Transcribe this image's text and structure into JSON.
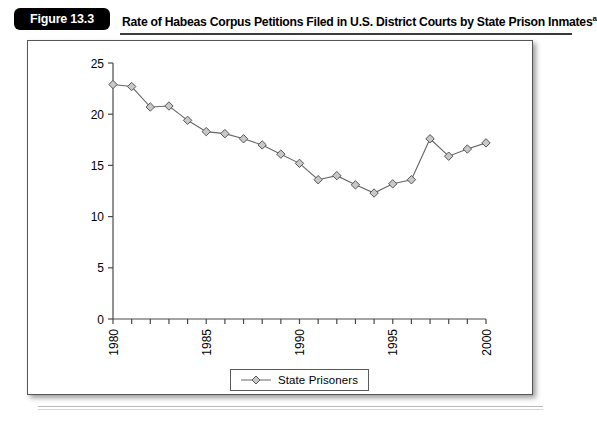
{
  "figure": {
    "badge_label": "Figure 13.3",
    "title": "Rate of Habeas Corpus Petitions Filed in U.S. District Courts by State Prison Inmates",
    "title_superscript": "a"
  },
  "legend": {
    "position": "bottom-center",
    "entries": [
      {
        "label": "State Prisoners",
        "marker": "diamond-icon",
        "color": "#666666"
      }
    ]
  },
  "axes": {
    "y_ticks": [
      "0",
      "5",
      "10",
      "15",
      "20",
      "25"
    ],
    "x_ticks_labeled": [
      "1980",
      "1985",
      "1990",
      "1995",
      "2000"
    ]
  },
  "colors": {
    "badge_background": "#000000",
    "badge_text": "#ffffff",
    "frame_border": "#555555",
    "axis": "#4a4a4a",
    "series_line": "#666666",
    "marker_fill": "#c8c8c8",
    "marker_stroke": "#555555"
  },
  "chart_data": {
    "type": "line",
    "title": "Rate of Habeas Corpus Petitions Filed in U.S. District Courts by State Prison Inmates",
    "xlabel": "",
    "ylabel": "",
    "xlim": [
      1980,
      2000
    ],
    "ylim": [
      0,
      25
    ],
    "ytick_step": 5,
    "xtick_step": 1,
    "xtick_label_step": 5,
    "xtick_label_rotation": 90,
    "grid": false,
    "legend_position": "bottom-center",
    "x": [
      1980,
      1981,
      1982,
      1983,
      1984,
      1985,
      1986,
      1987,
      1988,
      1989,
      1990,
      1991,
      1992,
      1993,
      1994,
      1995,
      1996,
      1997,
      1998,
      1999,
      2000
    ],
    "series": [
      {
        "name": "State Prisoners",
        "marker": "diamond",
        "values": [
          22.9,
          22.7,
          20.7,
          20.8,
          19.4,
          18.3,
          18.1,
          17.6,
          17.0,
          16.1,
          15.2,
          13.6,
          14.0,
          13.1,
          12.3,
          13.2,
          13.6,
          17.6,
          15.9,
          16.6,
          17.2
        ]
      }
    ]
  }
}
